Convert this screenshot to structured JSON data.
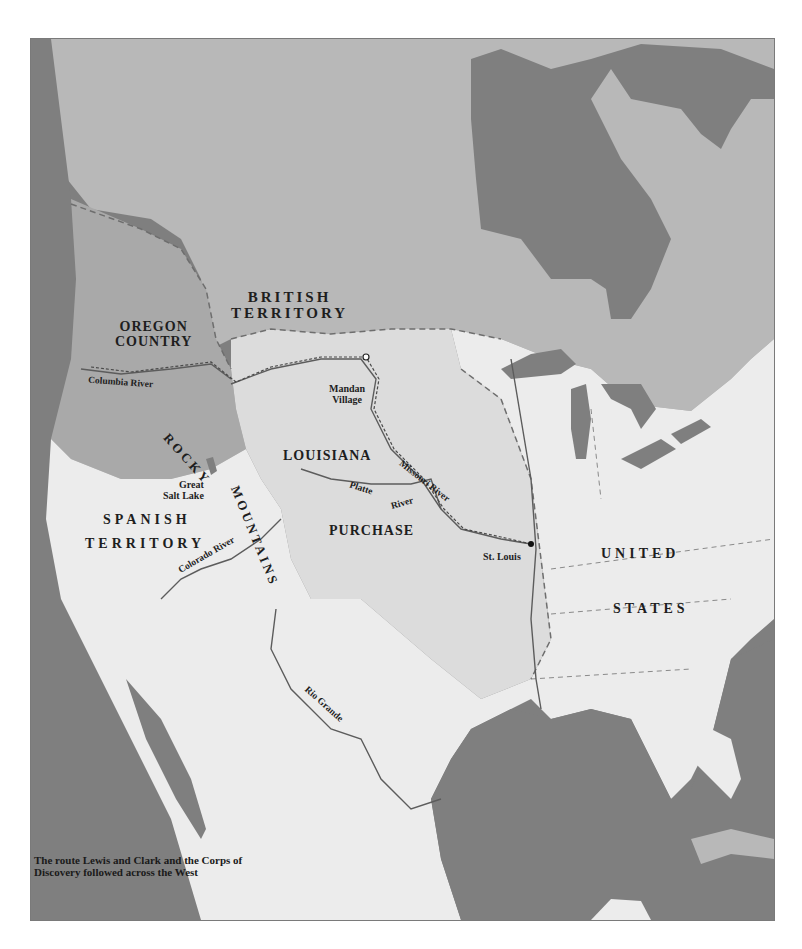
{
  "map": {
    "title": "Lewis and Clark Route Map",
    "caption": {
      "line1": "The route Lewis and Clark and the Corps of",
      "line2": "Discovery followed across the West"
    },
    "colors": {
      "water": "#7f7f7f",
      "british_territory": "#b8b8b8",
      "oregon_country": "#a9a9a9",
      "louisiana_purchase": "#dcdcdc",
      "spanish_territory": "#ececec",
      "united_states": "#ececec",
      "borders": "#6e6e6e",
      "rivers": "#5c5c5c",
      "route": "#4a4a4a"
    },
    "regions": {
      "british_line1": "BRITISH",
      "british_line2": "TERRITORY",
      "oregon_line1": "OREGON",
      "oregon_line2": "COUNTRY",
      "louisiana": "LOUISIANA",
      "purchase": "PURCHASE",
      "spanish": "SPANISH",
      "spanish_territory": "TERRITORY",
      "united": "UNITED",
      "states": "STATES",
      "rocky": "ROCKY",
      "mountains": "MOUNTAINS"
    },
    "places": {
      "mandan_line1": "Mandan",
      "mandan_line2": "Village",
      "st_louis": "St. Louis",
      "great_salt_line1": "Great",
      "great_salt_line2": "Salt Lake"
    },
    "rivers": {
      "columbia": "Columbia River",
      "missouri": "Missouri River",
      "platte": "Platte",
      "platte_river": "River",
      "colorado": "Colorado River",
      "rio_grande": "Rio Grande"
    }
  }
}
